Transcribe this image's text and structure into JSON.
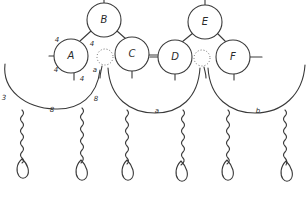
{
  "diagram": {
    "nodes": [
      {
        "id": "A",
        "label": "A",
        "cx": 71,
        "cy": 56,
        "r": 17
      },
      {
        "id": "B",
        "label": "B",
        "cx": 104,
        "cy": 20,
        "r": 17
      },
      {
        "id": "C",
        "label": "C",
        "cx": 132,
        "cy": 54,
        "r": 17
      },
      {
        "id": "D",
        "label": "D",
        "cx": 175,
        "cy": 57,
        "r": 17
      },
      {
        "id": "E",
        "label": "E",
        "cx": 205,
        "cy": 22,
        "r": 17
      },
      {
        "id": "F",
        "label": "F",
        "cx": 233,
        "cy": 57,
        "r": 17
      }
    ],
    "small_labels": [
      {
        "text": "4",
        "x": 57,
        "y": 40
      },
      {
        "text": "4",
        "x": 92,
        "y": 44
      },
      {
        "text": "4",
        "x": 56,
        "y": 70
      },
      {
        "text": "4",
        "x": 82,
        "y": 79
      },
      {
        "text": "a",
        "x": 95,
        "y": 70
      },
      {
        "text": "3",
        "x": 4,
        "y": 98
      },
      {
        "text": "8",
        "x": 96,
        "y": 99
      },
      {
        "text": "8",
        "x": 52,
        "y": 110
      },
      {
        "text": "a",
        "x": 157,
        "y": 111
      },
      {
        "text": "b",
        "x": 258,
        "y": 111
      }
    ],
    "arcs": [
      {
        "id": "left-arc",
        "label": "8"
      },
      {
        "id": "middle-arc",
        "label": "a"
      },
      {
        "id": "right-arc",
        "label": "b"
      }
    ],
    "chains": [
      {
        "id": "chain-1",
        "x": 22
      },
      {
        "id": "chain-2",
        "x": 80
      },
      {
        "id": "chain-3",
        "x": 127
      },
      {
        "id": "chain-4",
        "x": 181
      },
      {
        "id": "chain-5",
        "x": 227
      },
      {
        "id": "chain-6",
        "x": 286
      }
    ],
    "colors": {
      "line": "#3a3a3a",
      "background": "#ffffff"
    }
  }
}
